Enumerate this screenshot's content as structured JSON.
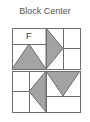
{
  "title": "Block Center",
  "colors": {
    "background": "#ffffff",
    "title_text": "#555555",
    "patch_light": "#ffffff",
    "patch_shaded": "#a3a3a3",
    "seam_line": "#6e6e6e",
    "label_text": "#404040"
  },
  "block": {
    "name": "Block Center",
    "orientation_label": "F",
    "halves": [
      {
        "name": "upper-half",
        "rotation_degrees": 0,
        "patches": [
          {
            "name": "plain-rectangle-upper-left",
            "shade": "light"
          },
          {
            "name": "orientation-letter-patch",
            "shade": "light",
            "label": "F"
          },
          {
            "name": "half-square-triangle-left",
            "shade": "shaded"
          },
          {
            "name": "flying-geese-triangle-center",
            "shade": "shaded"
          },
          {
            "name": "plain-rectangle-upper-right",
            "shade": "light"
          }
        ]
      },
      {
        "name": "lower-half",
        "rotation_degrees": 180,
        "patches": [
          {
            "name": "plain-rectangle-lower-left",
            "shade": "light"
          },
          {
            "name": "flying-geese-triangle-center",
            "shade": "shaded"
          },
          {
            "name": "half-square-triangle-right",
            "shade": "shaded"
          },
          {
            "name": "plain-rectangle-lower-right",
            "shade": "light"
          }
        ]
      }
    ]
  },
  "geometry": {
    "half_width": 68,
    "half_height": 41,
    "gap_between_halves": 2,
    "column_splits": [
      0,
      34,
      51,
      68
    ],
    "row_splits": [
      0,
      16,
      41
    ]
  }
}
